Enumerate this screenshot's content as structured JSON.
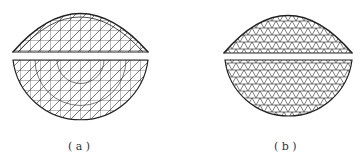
{
  "figures": [
    {
      "id": "a",
      "label": "( a )",
      "description": "dome elevation and plan with radial-ribbed triangulated grid"
    },
    {
      "id": "b",
      "label": "( b )",
      "description": "dome elevation and plan with geodesic triangulated grid"
    }
  ],
  "colors": {
    "line": "#222222",
    "background": "#ffffff"
  }
}
